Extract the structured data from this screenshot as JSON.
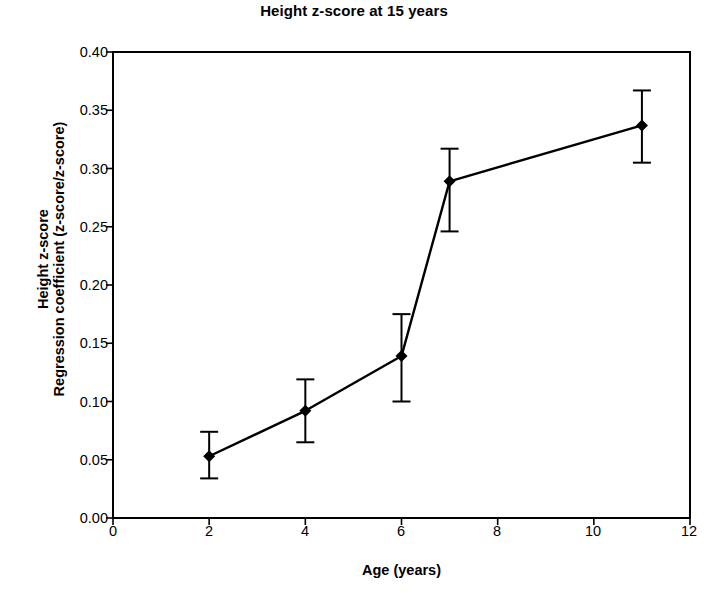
{
  "chart_data": {
    "type": "line",
    "title": "Height z-score at 15 years",
    "xlabel": "Age (years)",
    "ylabel_lines": [
      "Height z-score",
      "Regression coefficient (z-score/z-score)"
    ],
    "ylabel": "Height z-score Regression coefficient (z-score/z-score)",
    "x": [
      2,
      4,
      6,
      7,
      11
    ],
    "values": [
      0.053,
      0.092,
      0.139,
      0.289,
      0.337
    ],
    "error_low": [
      0.034,
      0.065,
      0.1,
      0.246,
      0.305
    ],
    "error_high": [
      0.074,
      0.119,
      0.175,
      0.317,
      0.367
    ],
    "xlim": [
      0,
      12
    ],
    "ylim": [
      0,
      0.4
    ],
    "xticks": [
      0,
      2,
      4,
      6,
      8,
      10,
      12
    ],
    "xtick_labels": [
      "0",
      "2",
      "4",
      "6",
      "8",
      "10",
      "12"
    ],
    "yticks": [
      0.0,
      0.05,
      0.1,
      0.15,
      0.2,
      0.25,
      0.3,
      0.35,
      0.4
    ],
    "ytick_labels": [
      "0.00",
      "0.05",
      "0.10",
      "0.15",
      "0.20",
      "0.25",
      "0.30",
      "0.35",
      "0.40"
    ],
    "grid": false,
    "legend": null,
    "marker": "diamond",
    "series_color": "#000000",
    "line_width": 2.4,
    "background": "#ffffff"
  }
}
